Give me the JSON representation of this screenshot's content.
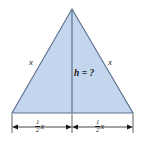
{
  "figure": {
    "name": "isosceles-triangle-height-diagram",
    "background_color": "#ffffff",
    "fill_color": "#c3d6ee",
    "edge_color": "#5b6e8c",
    "height_line_color": "#54688a",
    "dimension_color": "#1a1a1a",
    "text_color": "#1a1a1a"
  },
  "geometry": {
    "apex": {
      "x": 72,
      "y": 9
    },
    "base_left": {
      "x": 12,
      "y": 113
    },
    "base_right": {
      "x": 133,
      "y": 113
    },
    "height_foot": {
      "x": 72,
      "y": 113
    },
    "dimension_line_y": 127,
    "extension_tick_top": 114,
    "extension_tick_bottom": 133
  },
  "labels": {
    "side_left": "x",
    "side_right": "x",
    "height": "h = ?",
    "base_left_numerator": "1",
    "base_left_denominator": "2",
    "base_left_variable": "x",
    "base_right_numerator": "1",
    "base_right_denominator": "2",
    "base_right_variable": "x"
  }
}
